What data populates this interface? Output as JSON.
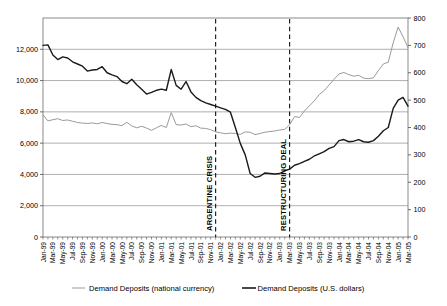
{
  "chart_data": {
    "type": "line",
    "title": "",
    "xlabel": "",
    "ylabel": "",
    "grid": true,
    "legend_position": "bottom",
    "left_axis": {
      "label": "Demand Deposits (national currency)",
      "ylim": [
        0,
        14000
      ],
      "ticks": [
        0,
        2000,
        4000,
        6000,
        8000,
        10000,
        12000
      ],
      "tick_labels": [
        "0",
        "2,000",
        "4,000",
        "6,000",
        "8,000",
        "10,000",
        "12,000"
      ]
    },
    "right_axis": {
      "label": "Demand Deposits (U.S. dollars)",
      "ylim": [
        0,
        800
      ],
      "ticks": [
        0,
        100,
        200,
        300,
        400,
        500,
        600,
        700,
        800
      ],
      "tick_labels": [
        "0",
        "100",
        "200",
        "300",
        "400",
        "500",
        "600",
        "700",
        "800"
      ]
    },
    "x": [
      "Jan-99",
      "Feb-99",
      "Mar-99",
      "Apr-99",
      "May-99",
      "Jun-99",
      "Jul-99",
      "Aug-99",
      "Sep-99",
      "Oct-99",
      "Nov-99",
      "Dec-99",
      "Jan-00",
      "Feb-00",
      "Mar-00",
      "Apr-00",
      "May-00",
      "Jun-00",
      "Jul-00",
      "Aug-00",
      "Sep-00",
      "Oct-00",
      "Nov-00",
      "Dec-00",
      "Jan-01",
      "Feb-01",
      "Mar-01",
      "Apr-01",
      "May-01",
      "Jun-01",
      "Jul-01",
      "Aug-01",
      "Sep-01",
      "Oct-01",
      "Nov-01",
      "Dec-01",
      "Jan-02",
      "Feb-02",
      "Mar-02",
      "Apr-02",
      "May-02",
      "Jun-02",
      "Jul-02",
      "Aug-02",
      "Sep-02",
      "Oct-02",
      "Nov-02",
      "Dec-02",
      "Jan-03",
      "Feb-03",
      "Mar-03",
      "Apr-03",
      "May-03",
      "Jun-03",
      "Jul-03",
      "Aug-03",
      "Sep-03",
      "Oct-03",
      "Nov-03",
      "Dec-03",
      "Jan-04",
      "Feb-04",
      "Mar-04",
      "Apr-04",
      "May-04",
      "Jun-04",
      "Jul-04",
      "Aug-04",
      "Sep-04",
      "Oct-04",
      "Nov-04",
      "Dec-04",
      "Jan-05",
      "Feb-05",
      "Mar-05"
    ],
    "x_tick_labels": [
      "Jan-99",
      "Mar-99",
      "May-99",
      "Jul-99",
      "Sep-99",
      "Nov-99",
      "Jan-00",
      "Mar-00",
      "May-00",
      "Jul-00",
      "Sep-00",
      "Nov-00",
      "Jan-01",
      "Mar-01",
      "May-01",
      "Jul-01",
      "Sep-01",
      "Nov-01",
      "Jan-02",
      "Mar-02",
      "May-02",
      "Jul-02",
      "Sep-02",
      "Nov-02",
      "Jan-03",
      "Mar-03",
      "May-03",
      "Jul-03",
      "Sep-03",
      "Nov-03",
      "Jan-04",
      "Mar-04",
      "May-04",
      "Jul-04",
      "Sep-04",
      "Nov-04",
      "Jan-05",
      "Mar-05"
    ],
    "series": [
      {
        "name": "Demand Deposits (national currency)",
        "axis": "left",
        "color": "#9a9a9a",
        "width": 1,
        "values": [
          7820,
          7420,
          7500,
          7560,
          7450,
          7480,
          7400,
          7320,
          7280,
          7260,
          7290,
          7240,
          7320,
          7250,
          7200,
          7180,
          7120,
          7330,
          7100,
          6980,
          7080,
          6960,
          6820,
          6980,
          7130,
          7000,
          7950,
          7180,
          7160,
          7220,
          7050,
          7110,
          6960,
          6940,
          6860,
          6720,
          6660,
          6600,
          6640,
          6620,
          6560,
          6720,
          6700,
          6540,
          6620,
          6700,
          6740,
          6780,
          6840,
          6880,
          7180,
          7700,
          7640,
          8060,
          8380,
          8700,
          9100,
          9360,
          9720,
          10080,
          10420,
          10520,
          10380,
          10280,
          10340,
          10160,
          10120,
          10180,
          10640,
          11060,
          11180,
          12420,
          13420,
          12800,
          12100
        ]
      },
      {
        "name": "Demand Deposits (U.S. dollars)",
        "axis": "right",
        "color": "#1a1a1a",
        "width": 1.4,
        "values": [
          700,
          702,
          665,
          648,
          658,
          654,
          640,
          632,
          624,
          606,
          610,
          612,
          622,
          600,
          592,
          586,
          568,
          560,
          576,
          556,
          540,
          522,
          528,
          536,
          540,
          536,
          612,
          554,
          540,
          568,
          530,
          510,
          498,
          490,
          484,
          478,
          472,
          466,
          456,
          400,
          342,
          300,
          232,
          218,
          222,
          234,
          232,
          230,
          232,
          242,
          248,
          262,
          268,
          276,
          284,
          296,
          304,
          312,
          324,
          330,
          352,
          356,
          348,
          350,
          356,
          348,
          346,
          352,
          368,
          388,
          400,
          470,
          500,
          510,
          478
        ]
      }
    ],
    "annotations": [
      {
        "name": "argentine-crisis",
        "label": "ARGENTINE CRISIS",
        "x": "Dec-01",
        "x_index": 35,
        "style": "dashed-vline"
      },
      {
        "name": "restructuring-deal",
        "label": "RESTRUCTURING DEAL",
        "x": "Mar-03",
        "x_index": 50,
        "style": "dashed-vline"
      }
    ]
  },
  "legend": {
    "items": [
      {
        "label": "Demand Deposits (national currency)",
        "color": "#9a9a9a"
      },
      {
        "label": "Demand Deposits (U.S. dollars)",
        "color": "#1a1a1a"
      }
    ]
  }
}
